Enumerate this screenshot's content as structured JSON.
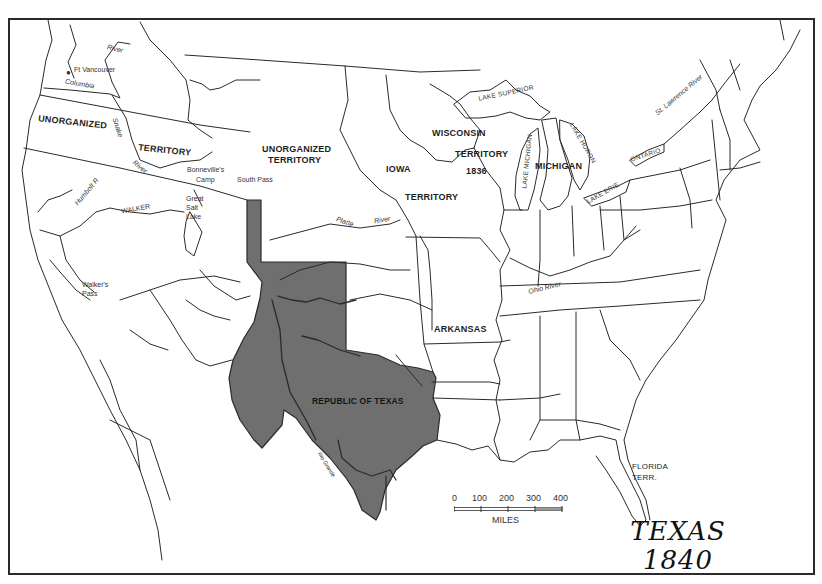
{
  "map": {
    "title_line1": "TEXAS",
    "title_line2": "1840",
    "colors": {
      "outline": "#2a2a2a",
      "texas_fill": "#6f6f6f",
      "background": "#ffffff"
    },
    "regions": [
      {
        "id": "unorganized-west-1",
        "label": "UNORGANIZED"
      },
      {
        "id": "unorganized-west-2",
        "label": "TERRITORY"
      },
      {
        "id": "unorganized-central-1",
        "label": "UNORGANIZED"
      },
      {
        "id": "unorganized-central-2",
        "label": "TERRITORY"
      },
      {
        "id": "iowa-1",
        "label": "IOWA"
      },
      {
        "id": "iowa-2",
        "label": "TERRITORY"
      },
      {
        "id": "wisconsin-1",
        "label": "WISCONSIN"
      },
      {
        "id": "wisconsin-2",
        "label": "TERRITORY"
      },
      {
        "id": "wisconsin-3",
        "label": "1836"
      },
      {
        "id": "michigan",
        "label": "MICHIGAN"
      },
      {
        "id": "arkansas",
        "label": "ARKANSAS"
      },
      {
        "id": "republic-of-texas",
        "label": "REPUBLIC OF TEXAS"
      },
      {
        "id": "florida-1",
        "label": "FLORIDA"
      },
      {
        "id": "florida-2",
        "label": "TERR."
      }
    ],
    "places": [
      {
        "id": "ft-vancouver",
        "label": "Ft Vancouver"
      },
      {
        "id": "bonnevilles-camp-1",
        "label": "Bonneville's"
      },
      {
        "id": "bonnevilles-camp-2",
        "label": "Camp"
      },
      {
        "id": "south-pass",
        "label": "South Pass"
      },
      {
        "id": "great-salt-lake-1",
        "label": "Great"
      },
      {
        "id": "great-salt-lake-2",
        "label": "Salt"
      },
      {
        "id": "great-salt-lake-3",
        "label": "Lake"
      },
      {
        "id": "walkers-pass-1",
        "label": "Walker's"
      },
      {
        "id": "walkers-pass-2",
        "label": "Pass"
      },
      {
        "id": "walker",
        "label": "WALKER"
      }
    ],
    "water": [
      {
        "id": "river-north",
        "label": "River"
      },
      {
        "id": "columbia",
        "label": "Columbia"
      },
      {
        "id": "snake",
        "label": "Snake"
      },
      {
        "id": "snake-river",
        "label": "River"
      },
      {
        "id": "humbolt",
        "label": "Humbolt R"
      },
      {
        "id": "platte",
        "label": "Platte"
      },
      {
        "id": "platte-river",
        "label": "River"
      },
      {
        "id": "ohio-river",
        "label": "Ohio River"
      },
      {
        "id": "st-lawrence",
        "label": "St. Lawrence River"
      },
      {
        "id": "rio-grande",
        "label": "Rio Grande"
      },
      {
        "id": "lake-superior",
        "label": "LAKE SUPERIOR"
      },
      {
        "id": "lake-michigan",
        "label": "LAKE MICHIGAN"
      },
      {
        "id": "lake-huron",
        "label": "LAKE HURON"
      },
      {
        "id": "lake-erie",
        "label": "LAKE ERIE"
      },
      {
        "id": "ontario",
        "label": "ONTARIO"
      }
    ],
    "scale": {
      "ticks": [
        "0",
        "100",
        "200",
        "300",
        "400"
      ],
      "unit": "MILES"
    }
  }
}
